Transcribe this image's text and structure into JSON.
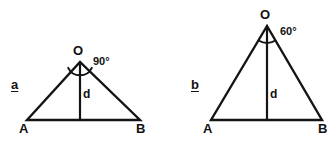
{
  "canvas": {
    "width": 336,
    "height": 144,
    "background": "#ffffff",
    "stroke_color": "#141414"
  },
  "figures": [
    {
      "id": "figure-a",
      "case_label": "a",
      "apex_label": "O",
      "angle_label": "90°",
      "angle_value": 90,
      "height_label": "d",
      "left_vertex_label": "A",
      "right_vertex_label": "B",
      "geometry": {
        "apex": [
          80,
          62
        ],
        "left_vertex": [
          27,
          120
        ],
        "right_vertex": [
          140,
          120
        ],
        "foot": [
          80,
          120
        ],
        "arc_radius": 13
      }
    },
    {
      "id": "figure-b",
      "case_label": "b",
      "apex_label": "O",
      "angle_label": "60°",
      "angle_value": 60,
      "height_label": "d",
      "left_vertex_label": "A",
      "right_vertex_label": "B",
      "geometry": {
        "apex": [
          267,
          26
        ],
        "left_vertex": [
          211,
          120
        ],
        "right_vertex": [
          322,
          120
        ],
        "foot": [
          267,
          120
        ],
        "arc_radius": 16
      }
    }
  ],
  "footer": {
    "clipped_text": ""
  }
}
